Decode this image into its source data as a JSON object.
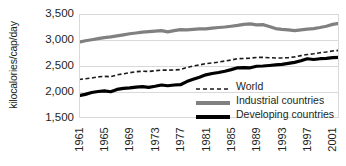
{
  "chart_data": {
    "type": "line",
    "title": "",
    "subtitle": "",
    "xlabel": "",
    "ylabel": "kilocalories/cap/day",
    "xlim": [
      1961,
      2002
    ],
    "ylim": [
      1500,
      3500
    ],
    "ytick_values": [
      3500,
      3000,
      2500,
      2000,
      1500
    ],
    "ytick_labels": [
      "3,500",
      "3,000",
      "2,500",
      "2,000",
      "1,500"
    ],
    "grid": "horizontal",
    "legend_position": "inside-lower-right",
    "x": [
      1961,
      1962,
      1963,
      1964,
      1965,
      1966,
      1967,
      1968,
      1969,
      1970,
      1971,
      1972,
      1973,
      1974,
      1975,
      1976,
      1977,
      1978,
      1979,
      1980,
      1981,
      1982,
      1983,
      1984,
      1985,
      1986,
      1987,
      1988,
      1989,
      1990,
      1991,
      1992,
      1993,
      1994,
      1995,
      1996,
      1997,
      1998,
      1999,
      2000,
      2001,
      2002
    ],
    "xtick_values": [
      1961,
      1965,
      1969,
      1973,
      1977,
      1981,
      1985,
      1989,
      1993,
      1997,
      2001
    ],
    "xtick_labels": [
      "1961",
      "1965",
      "1969",
      "1973",
      "1977",
      "1981",
      "1985",
      "1989",
      "1993",
      "1997",
      "2001"
    ],
    "series": [
      {
        "name": "World",
        "style": "dashed",
        "color": "#1a1a1a",
        "width": 1.6,
        "values": [
          2240,
          2255,
          2270,
          2290,
          2300,
          2295,
          2330,
          2350,
          2370,
          2390,
          2400,
          2395,
          2410,
          2420,
          2420,
          2425,
          2430,
          2470,
          2500,
          2520,
          2545,
          2560,
          2575,
          2595,
          2615,
          2640,
          2645,
          2650,
          2665,
          2665,
          2660,
          2655,
          2655,
          2660,
          2675,
          2700,
          2720,
          2735,
          2755,
          2770,
          2790,
          2800
        ]
      },
      {
        "name": "Industrial countries",
        "style": "solid",
        "color": "#808080",
        "width": 3.2,
        "values": [
          2960,
          2985,
          3005,
          3025,
          3045,
          3060,
          3080,
          3100,
          3120,
          3135,
          3150,
          3160,
          3170,
          3180,
          3155,
          3180,
          3200,
          3195,
          3205,
          3215,
          3215,
          3230,
          3240,
          3250,
          3265,
          3280,
          3300,
          3310,
          3290,
          3295,
          3260,
          3220,
          3205,
          3195,
          3180,
          3195,
          3210,
          3220,
          3240,
          3265,
          3300,
          3320
        ]
      },
      {
        "name": "Developing countries",
        "style": "solid",
        "color": "#000000",
        "width": 3.2,
        "values": [
          1930,
          1955,
          1990,
          2010,
          2020,
          2005,
          2050,
          2070,
          2080,
          2095,
          2105,
          2090,
          2110,
          2135,
          2120,
          2135,
          2140,
          2200,
          2245,
          2285,
          2330,
          2355,
          2375,
          2400,
          2430,
          2465,
          2470,
          2465,
          2495,
          2500,
          2510,
          2520,
          2530,
          2550,
          2570,
          2600,
          2640,
          2625,
          2640,
          2645,
          2660,
          2665
        ]
      }
    ]
  },
  "legend": {
    "items": [
      {
        "label": "World",
        "swatch": "dashed-line-swatch"
      },
      {
        "label": "Industrial countries",
        "swatch": "gray-line-swatch"
      },
      {
        "label": "Developing countries",
        "swatch": "black-line-swatch"
      }
    ]
  },
  "colors": {
    "grid": "#d9d9d9",
    "text": "#231f20",
    "world": "#1a1a1a",
    "industrial": "#808080",
    "developing": "#000000"
  }
}
